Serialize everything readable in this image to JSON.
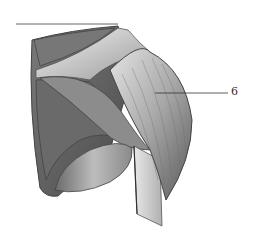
{
  "figure": {
    "labels": [
      {
        "number": "6",
        "pointer": {
          "x1": 155,
          "y1": 93,
          "x2": 228,
          "y2": 93
        }
      }
    ]
  },
  "colors": {
    "background": "#ffffff",
    "ink": "#333333",
    "shade_dark": "#4a4a4a",
    "shade_mid": "#8a8a8a",
    "shade_light": "#d8d8d8"
  }
}
